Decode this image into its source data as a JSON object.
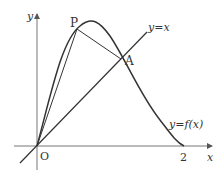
{
  "diagram": {
    "axes": {
      "x_label": "x",
      "y_label": "y",
      "origin_label": "O",
      "x_tick": "2"
    },
    "points": {
      "P": "P",
      "A": "A"
    },
    "curve_labels": {
      "line": "y=x",
      "curve": "y=f(x)"
    },
    "colors": {
      "stroke": "#333333",
      "axis": "#777777"
    }
  }
}
